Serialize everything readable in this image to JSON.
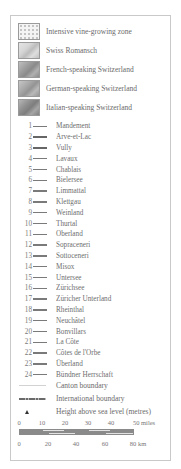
{
  "legend": {
    "zones": [
      {
        "label": "Intensive vine-growing zone",
        "fill": "#f4f4f4",
        "style": "dots"
      },
      {
        "label": "Swiss Romansch",
        "fill": "#d6d6d6",
        "style": "relief"
      },
      {
        "label": "French-speaking Switzerland",
        "fill": "#9d9d9d",
        "style": "relief"
      },
      {
        "label": "German-speaking Switzerland",
        "fill": "#a8a8a8",
        "style": "relief"
      },
      {
        "label": "Italian-speaking Switzerland",
        "fill": "#8f8f8f",
        "style": "relief"
      }
    ],
    "regions": [
      {
        "num": "1",
        "name": "Mandement"
      },
      {
        "num": "2",
        "name": "Arve-et-Lac"
      },
      {
        "num": "3",
        "name": "Vully"
      },
      {
        "num": "4",
        "name": "Lavaux"
      },
      {
        "num": "5",
        "name": "Chablais"
      },
      {
        "num": "6",
        "name": "Bielersee"
      },
      {
        "num": "7",
        "name": "Limmattal"
      },
      {
        "num": "8",
        "name": "Klettgau"
      },
      {
        "num": "9",
        "name": "Weinland"
      },
      {
        "num": "10",
        "name": "Thurtal"
      },
      {
        "num": "11",
        "name": "Oberland"
      },
      {
        "num": "12",
        "name": "Sopraceneri"
      },
      {
        "num": "13",
        "name": "Sottoceneri"
      },
      {
        "num": "14",
        "name": "Misox"
      },
      {
        "num": "15",
        "name": "Untersee"
      },
      {
        "num": "16",
        "name": "Zürichsee"
      },
      {
        "num": "17",
        "name": "Züricher Unterland"
      },
      {
        "num": "18",
        "name": "Rheinthal"
      },
      {
        "num": "19",
        "name": "Neuchâtel"
      },
      {
        "num": "20",
        "name": "Bonvillars"
      },
      {
        "num": "21",
        "name": "La Côte"
      },
      {
        "num": "22",
        "name": "Côtes de l'Orbe"
      },
      {
        "num": "23",
        "name": "Überland"
      },
      {
        "num": "24",
        "name": "Bündner Herrschaft"
      }
    ],
    "symbols": {
      "canton_boundary": "Canton boundary",
      "international_boundary": "International boundary",
      "height": "Height above sea level (metres)"
    },
    "scale": {
      "miles_ticks": [
        "0",
        "10",
        "20",
        "30",
        "40",
        "50 miles"
      ],
      "km_ticks": [
        "0",
        "20",
        "40",
        "60",
        "80 km"
      ]
    }
  }
}
